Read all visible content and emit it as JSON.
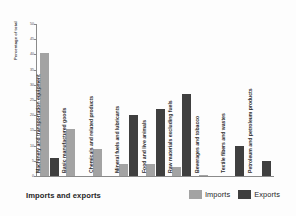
{
  "chart_data": {
    "type": "bar",
    "title": "Imports and exports",
    "xlabel": "",
    "ylabel": "Percentage of total",
    "ylim": [
      0,
      50
    ],
    "yticks": [
      0,
      5,
      10,
      15,
      20,
      25,
      30,
      35,
      40,
      45,
      50
    ],
    "grid": false,
    "legend_position": "bottom-right",
    "categories": [
      "Machinery and transportation equipment",
      "Basic manufactured goods",
      "Chemicals and related products",
      "Mineral fuels and lubricants",
      "Food and live animals",
      "Raw materials excluding fuels",
      "Beverages and tobacco",
      "Textile fibers and wastes",
      "Petroleum and petroleum products"
    ],
    "series": [
      {
        "name": "Imports",
        "color": "#a3a3a3",
        "values": [
          40.5,
          15.5,
          9.0,
          4.0,
          4.0,
          3.0,
          0.3,
          0.0,
          0.0
        ]
      },
      {
        "name": "Exports",
        "color": "#3f3f3f",
        "values": [
          6.0,
          0.0,
          0.0,
          20.0,
          22.0,
          27.0,
          0.0,
          10.0,
          5.0
        ]
      }
    ]
  },
  "legend": {
    "items": [
      {
        "label": "Imports",
        "color": "#a3a3a3"
      },
      {
        "label": "Exports",
        "color": "#3f3f3f"
      }
    ]
  }
}
